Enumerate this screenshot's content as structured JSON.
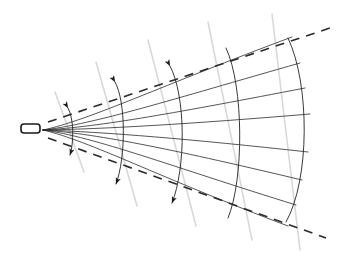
{
  "figure": {
    "title": "Expanding wavefront cone diagram",
    "canvas": {
      "width": 340,
      "height": 264,
      "background": "#ffffff"
    },
    "colors": {
      "ink": "#1a1a1a",
      "ray": "#2b2b2b",
      "arc": "#222222",
      "dashed": "#2a2a2a",
      "guide": "#d9d9d9",
      "background": "#ffffff"
    },
    "strokes": {
      "ray_width": 0.8,
      "arc_width": 0.9,
      "dashed_width": 1.6,
      "dash_pattern": "9 7",
      "guide_width": 1.6,
      "source_width": 1.6
    }
  },
  "source": {
    "label": "source-capsule",
    "x": 21,
    "y": 124,
    "width": 19,
    "height": 9,
    "radius": 3
  },
  "apex": {
    "x": 43,
    "y": 130
  },
  "chart_data": {
    "type": "line",
    "title": "Expanding wavefront cone diagram",
    "xlabel": "",
    "ylabel": "",
    "xlim": [
      0,
      340
    ],
    "ylim": [
      0,
      264
    ],
    "grid": false,
    "legend": null,
    "annotations": [
      "source capsule at left apex",
      "five nested double-headed arc wavefronts",
      "eight diverging curved rays",
      "two dashed cone boundary lines",
      "faint grey tangent guide lines at arc endpoints"
    ],
    "rays": [
      {
        "name": "ray-up-4",
        "path": "M43,130 C90,120 160,86 292,37"
      },
      {
        "name": "ray-up-3",
        "path": "M43,130 C95,124 170,100 300,63"
      },
      {
        "name": "ray-up-2",
        "path": "M43,130 C100,127 180,112 305,88"
      },
      {
        "name": "ray-up-1",
        "path": "M43,130 C105,129 190,124 310,114"
      },
      {
        "name": "ray-dn-1",
        "path": "M43,130 C105,132 190,139 308,152"
      },
      {
        "name": "ray-dn-2",
        "path": "M43,130 C100,134 180,151 302,180"
      },
      {
        "name": "ray-dn-3",
        "path": "M43,130 C95,137 170,166 296,205"
      },
      {
        "name": "ray-dn-4",
        "path": "M43,130 C90,141 158,177 288,226"
      }
    ],
    "wavefronts": [
      {
        "name": "wavefront-1",
        "index": 1,
        "path": "M68,108 C74,118 74,143 70,155",
        "top": [
          68,
          108
        ],
        "bottom": [
          70,
          155
        ],
        "arrow_top": true,
        "arrow_bottom": true
      },
      {
        "name": "wavefront-2",
        "index": 2,
        "path": "M115,82 C126,101 126,158 116,184",
        "top": [
          115,
          82
        ],
        "bottom": [
          116,
          184
        ],
        "arrow_top": true,
        "arrow_bottom": true
      },
      {
        "name": "wavefront-3",
        "index": 3,
        "path": "M170,66 C186,96 186,168 172,203",
        "top": [
          170,
          66
        ],
        "bottom": [
          172,
          203
        ],
        "arrow_top": true,
        "arrow_bottom": true
      },
      {
        "name": "wavefront-4",
        "index": 4,
        "path": "M226,48 C244,86 244,180 228,218",
        "top": [
          226,
          48
        ],
        "bottom": [
          228,
          218
        ],
        "arrow_top": false,
        "arrow_bottom": false
      },
      {
        "name": "wavefront-5",
        "index": 5,
        "path": "M288,38 C310,84 310,180 286,222",
        "top": [
          288,
          38
        ],
        "bottom": [
          286,
          222
        ],
        "arrow_top": false,
        "arrow_bottom": false
      }
    ],
    "dashed_boundaries": [
      {
        "name": "dashed-upper",
        "x1": 48,
        "y1": 122,
        "x2": 330,
        "y2": 28
      },
      {
        "name": "dashed-lower",
        "x1": 48,
        "y1": 138,
        "x2": 326,
        "y2": 238
      }
    ],
    "guides": [
      {
        "name": "guide-1",
        "x1": 55,
        "y1": 92,
        "x2": 84,
        "y2": 172
      },
      {
        "name": "guide-2",
        "x1": 96,
        "y1": 62,
        "x2": 137,
        "y2": 206
      },
      {
        "name": "guide-3",
        "x1": 148,
        "y1": 40,
        "x2": 196,
        "y2": 226
      },
      {
        "name": "guide-4",
        "x1": 208,
        "y1": 22,
        "x2": 252,
        "y2": 240
      },
      {
        "name": "guide-5",
        "x1": 272,
        "y1": 14,
        "x2": 300,
        "y2": 250
      }
    ]
  }
}
